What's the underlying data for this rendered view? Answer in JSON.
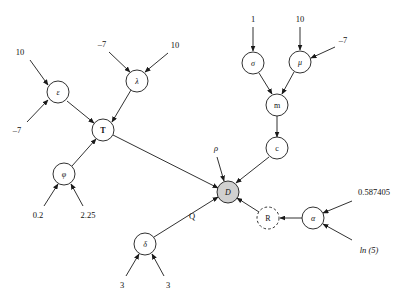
{
  "diagram": {
    "background_color": "#ffffff",
    "stroke_color": "#1a1a1a",
    "highlight_fill": "#d0d0d0",
    "nodes": [
      {
        "id": "epsilon",
        "label": "ε",
        "x": 58,
        "y": 92,
        "r": 11,
        "style": "solid",
        "italic": true,
        "bold": false
      },
      {
        "id": "lambda",
        "label": "λ",
        "x": 137,
        "y": 81,
        "r": 11,
        "style": "solid",
        "italic": true,
        "bold": false
      },
      {
        "id": "T",
        "label": "T",
        "x": 103,
        "y": 130,
        "r": 11,
        "style": "solid",
        "italic": false,
        "bold": true
      },
      {
        "id": "phi",
        "label": "φ",
        "x": 64,
        "y": 174,
        "r": 11,
        "style": "solid",
        "italic": true,
        "bold": false
      },
      {
        "id": "delta",
        "label": "δ",
        "x": 145,
        "y": 244,
        "r": 11,
        "style": "solid",
        "italic": true,
        "bold": false
      },
      {
        "id": "sigma",
        "label": "σ",
        "x": 253,
        "y": 63,
        "r": 11,
        "style": "solid",
        "italic": true,
        "bold": false
      },
      {
        "id": "mu",
        "label": "μ",
        "x": 300,
        "y": 62,
        "r": 11,
        "style": "solid",
        "italic": true,
        "bold": false
      },
      {
        "id": "m",
        "label": "m",
        "x": 277,
        "y": 105,
        "r": 11,
        "style": "solid",
        "italic": false,
        "bold": false
      },
      {
        "id": "c",
        "label": "c",
        "x": 277,
        "y": 148,
        "r": 11,
        "style": "solid",
        "italic": false,
        "bold": false
      },
      {
        "id": "D",
        "label": "D",
        "x": 228,
        "y": 192,
        "r": 11,
        "style": "filled",
        "italic": true,
        "bold": false
      },
      {
        "id": "R",
        "label": "R",
        "x": 268,
        "y": 218,
        "r": 11,
        "style": "dashed",
        "italic": false,
        "bold": false
      },
      {
        "id": "alpha",
        "label": "α",
        "x": 313,
        "y": 218,
        "r": 11,
        "style": "solid",
        "italic": true,
        "bold": false
      }
    ],
    "leaf_labels": [
      {
        "id": "leaf-eps-10",
        "text": "10",
        "x": 20,
        "y": 52,
        "italic": false
      },
      {
        "id": "leaf-eps-neg7",
        "text": "–7",
        "x": 17,
        "y": 130,
        "italic": false
      },
      {
        "id": "leaf-lam-neg7",
        "text": "–7",
        "x": 102,
        "y": 44,
        "italic": false
      },
      {
        "id": "leaf-lam-10",
        "text": "10",
        "x": 175,
        "y": 45,
        "italic": false
      },
      {
        "id": "leaf-phi-02",
        "text": "0.2",
        "x": 38,
        "y": 215,
        "italic": false
      },
      {
        "id": "leaf-phi-225",
        "text": "2.25",
        "x": 88,
        "y": 215,
        "italic": false
      },
      {
        "id": "leaf-delta-3a",
        "text": "3",
        "x": 122,
        "y": 285,
        "italic": false
      },
      {
        "id": "leaf-delta-3b",
        "text": "3",
        "x": 168,
        "y": 285,
        "italic": false
      },
      {
        "id": "leaf-sigma-1",
        "text": "1",
        "x": 253,
        "y": 19,
        "italic": false
      },
      {
        "id": "leaf-mu-10",
        "text": "10",
        "x": 300,
        "y": 19,
        "italic": false
      },
      {
        "id": "leaf-mu-neg7",
        "text": "–7",
        "x": 343,
        "y": 40,
        "italic": false
      },
      {
        "id": "leaf-alpha-num",
        "text": "0.587405",
        "x": 374,
        "y": 192,
        "italic": false
      },
      {
        "id": "leaf-alpha-ln5",
        "text": "ln (5)",
        "x": 369,
        "y": 250,
        "italic": true
      }
    ],
    "edge_tags": [
      {
        "id": "tag-rho",
        "text": "ρ",
        "x": 216,
        "y": 148,
        "italic": true
      },
      {
        "id": "tag-Q",
        "text": "Q",
        "x": 192,
        "y": 216,
        "italic": false
      }
    ],
    "edges": [
      {
        "id": "e-10-eps",
        "from": "leaf-eps-10",
        "to": "epsilon",
        "x1": 30,
        "y1": 60,
        "x2": 48,
        "y2": 85
      },
      {
        "id": "e-neg7-eps",
        "from": "leaf-eps-neg7",
        "to": "epsilon",
        "x1": 27,
        "y1": 122,
        "x2": 48,
        "y2": 100
      },
      {
        "id": "e-neg7-lam",
        "from": "leaf-lam-neg7",
        "to": "lambda",
        "x1": 109,
        "y1": 52,
        "x2": 130,
        "y2": 72
      },
      {
        "id": "e-10-lam",
        "from": "leaf-lam-10",
        "to": "lambda",
        "x1": 168,
        "y1": 53,
        "x2": 145,
        "y2": 72
      },
      {
        "id": "e-eps-T",
        "from": "epsilon",
        "to": "T",
        "x1": 67,
        "y1": 101,
        "x2": 94,
        "y2": 123
      },
      {
        "id": "e-lam-T",
        "from": "lambda",
        "to": "T",
        "x1": 131,
        "y1": 90,
        "x2": 112,
        "y2": 122
      },
      {
        "id": "e-phi-T",
        "from": "phi",
        "to": "T",
        "x1": 72,
        "y1": 166,
        "x2": 96,
        "y2": 139
      },
      {
        "id": "e-02-phi",
        "from": "leaf-phi-02",
        "to": "phi",
        "x1": 44,
        "y1": 206,
        "x2": 58,
        "y2": 184
      },
      {
        "id": "e-225-phi",
        "from": "leaf-phi-225",
        "to": "phi",
        "x1": 83,
        "y1": 206,
        "x2": 71,
        "y2": 184
      },
      {
        "id": "e-T-D",
        "from": "T",
        "to": "D",
        "x1": 113,
        "y1": 135,
        "x2": 218,
        "y2": 188
      },
      {
        "id": "e-3a-delta",
        "from": "leaf-delta-3a",
        "to": "delta",
        "x1": 126,
        "y1": 276,
        "x2": 139,
        "y2": 254
      },
      {
        "id": "e-3b-delta",
        "from": "leaf-delta-3b",
        "to": "delta",
        "x1": 164,
        "y1": 276,
        "x2": 152,
        "y2": 254
      },
      {
        "id": "e-delta-D",
        "from": "delta",
        "to": "D",
        "x1": 154,
        "y1": 237,
        "x2": 218,
        "y2": 197
      },
      {
        "id": "e-1-sigma",
        "from": "leaf-sigma-1",
        "to": "sigma",
        "x1": 253,
        "y1": 27,
        "x2": 253,
        "y2": 51
      },
      {
        "id": "e-10-mu",
        "from": "leaf-mu-10",
        "to": "mu",
        "x1": 300,
        "y1": 27,
        "x2": 300,
        "y2": 50
      },
      {
        "id": "e-neg7-mu",
        "from": "leaf-mu-neg7",
        "to": "mu",
        "x1": 335,
        "y1": 47,
        "x2": 311,
        "y2": 58
      },
      {
        "id": "e-sigma-m",
        "from": "sigma",
        "to": "m",
        "x1": 259,
        "y1": 73,
        "x2": 272,
        "y2": 94
      },
      {
        "id": "e-mu-m",
        "from": "mu",
        "to": "m",
        "x1": 294,
        "y1": 72,
        "x2": 282,
        "y2": 94
      },
      {
        "id": "e-m-c",
        "from": "m",
        "to": "c",
        "x1": 277,
        "y1": 116,
        "x2": 277,
        "y2": 137
      },
      {
        "id": "e-c-D",
        "from": "c",
        "to": "D",
        "x1": 269,
        "y1": 157,
        "x2": 236,
        "y2": 183
      },
      {
        "id": "e-rho-D",
        "from": "tag-rho",
        "to": "D",
        "x1": 217,
        "y1": 157,
        "x2": 224,
        "y2": 181
      },
      {
        "id": "e-R-D",
        "from": "R",
        "to": "D",
        "x1": 259,
        "y1": 212,
        "x2": 237,
        "y2": 198
      },
      {
        "id": "e-alpha-R",
        "from": "alpha",
        "to": "R",
        "x1": 302,
        "y1": 218,
        "x2": 280,
        "y2": 218
      },
      {
        "id": "e-num-alpha",
        "from": "leaf-alpha-num",
        "to": "alpha",
        "x1": 352,
        "y1": 201,
        "x2": 323,
        "y2": 213
      },
      {
        "id": "e-ln5-alpha",
        "from": "leaf-alpha-ln5",
        "to": "alpha",
        "x1": 352,
        "y1": 240,
        "x2": 323,
        "y2": 224
      }
    ]
  }
}
